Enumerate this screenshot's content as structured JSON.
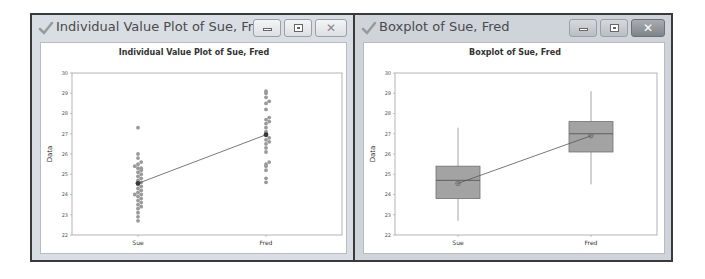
{
  "windows": [
    {
      "title": "Individual Value Plot of Sue, Fred",
      "buttons": {
        "minimize": "minimize",
        "maximize": "maximize",
        "close": "close"
      },
      "icon": "checkmark-icon"
    },
    {
      "title": "Boxplot of Sue, Fred",
      "buttons": {
        "minimize": "minimize",
        "maximize": "maximize",
        "close": "close"
      },
      "icon": "checkmark-icon"
    }
  ],
  "colors": {
    "dot": "#9a9a9a",
    "mean": "#3a3a3a",
    "box_fill": "#a3a3a3",
    "box_edge": "#707070",
    "line": "#555555",
    "axis": "#a0a0a0"
  },
  "chart_data": [
    {
      "type": "scatter",
      "title": "Individual Value Plot of Sue, Fred",
      "xlabel": "",
      "ylabel": "Data",
      "categories": [
        "Sue",
        "Fred"
      ],
      "ylim": [
        22,
        30
      ],
      "yticks": [
        22,
        23,
        24,
        25,
        26,
        27,
        28,
        29,
        30
      ],
      "grid": false,
      "series": [
        {
          "name": "Sue",
          "values": [
            22.7,
            22.9,
            23.1,
            23.3,
            23.4,
            23.5,
            23.6,
            23.7,
            23.8,
            23.9,
            24.0,
            24.0,
            24.1,
            24.2,
            24.3,
            24.4,
            24.5,
            24.6,
            24.7,
            24.8,
            24.9,
            25.0,
            25.1,
            25.2,
            25.3,
            25.3,
            25.4,
            25.5,
            25.6,
            25.8,
            26.0,
            27.3
          ]
        },
        {
          "name": "Fred",
          "values": [
            24.6,
            24.8,
            25.2,
            25.4,
            25.5,
            25.6,
            26.1,
            26.3,
            26.5,
            26.6,
            26.7,
            26.8,
            27.0,
            27.1,
            27.3,
            27.5,
            27.6,
            27.7,
            27.8,
            28.2,
            28.5,
            28.6,
            28.8,
            29.0,
            29.1
          ]
        }
      ],
      "means": {
        "Sue": 24.55,
        "Fred": 26.95
      },
      "annotations": [
        "mean connect line from Sue to Fred"
      ]
    },
    {
      "type": "boxplot",
      "title": "Boxplot of Sue, Fred",
      "xlabel": "",
      "ylabel": "Data",
      "categories": [
        "Sue",
        "Fred"
      ],
      "ylim": [
        22,
        30
      ],
      "yticks": [
        22,
        23,
        24,
        25,
        26,
        27,
        28,
        29,
        30
      ],
      "grid": false,
      "series": [
        {
          "name": "Sue",
          "min": 22.7,
          "q1": 23.8,
          "median": 24.7,
          "q3": 25.4,
          "max": 27.3,
          "mean": 24.55
        },
        {
          "name": "Fred",
          "min": 24.5,
          "q1": 26.1,
          "median": 27.0,
          "q3": 27.6,
          "max": 29.1,
          "mean": 26.9
        }
      ],
      "annotations": [
        "mean connect line from Sue to Fred"
      ]
    }
  ]
}
